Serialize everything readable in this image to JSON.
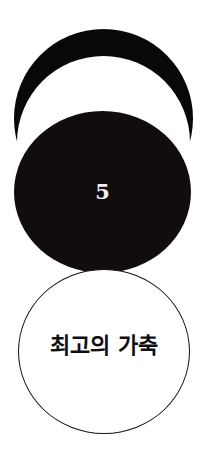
{
  "poster": {
    "background_color": "#ffffff",
    "shapes": {
      "top_crescent": {
        "name": "crescent-arc",
        "fill_color": "#0a0807"
      },
      "middle_disc": {
        "name": "solid-black-circle",
        "fill_color": "#110d0c",
        "number": "5",
        "number_color": "#f4f2ef"
      },
      "bottom_disc": {
        "name": "outlined-white-circle",
        "fill_color": "#ffffff",
        "stroke_color": "#151313",
        "title": "최고의 가축",
        "title_color": "#100e0e"
      }
    }
  }
}
